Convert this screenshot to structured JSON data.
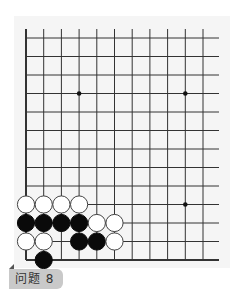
{
  "problem": {
    "label": "问题 8",
    "label_bg": "#c9c9c9"
  },
  "board": {
    "columns_visible": 11,
    "rows_visible": 13,
    "edges": [
      "left",
      "bottom"
    ],
    "star_points": [
      {
        "col": 3,
        "row": 3
      },
      {
        "col": 9,
        "row": 3
      },
      {
        "col": 9,
        "row": 9
      }
    ],
    "stones": [
      {
        "color": "white",
        "col": 0,
        "row": 9
      },
      {
        "color": "white",
        "col": 1,
        "row": 9
      },
      {
        "color": "white",
        "col": 2,
        "row": 9
      },
      {
        "color": "white",
        "col": 3,
        "row": 9
      },
      {
        "color": "black",
        "col": 0,
        "row": 10
      },
      {
        "color": "black",
        "col": 1,
        "row": 10
      },
      {
        "color": "black",
        "col": 2,
        "row": 10
      },
      {
        "color": "black",
        "col": 3,
        "row": 10
      },
      {
        "color": "white",
        "col": 4,
        "row": 10
      },
      {
        "color": "white",
        "col": 5,
        "row": 10
      },
      {
        "color": "white",
        "col": 0,
        "row": 11
      },
      {
        "color": "white",
        "col": 1,
        "row": 11
      },
      {
        "color": "black",
        "col": 3,
        "row": 11
      },
      {
        "color": "black",
        "col": 4,
        "row": 11
      },
      {
        "color": "white",
        "col": 5,
        "row": 11
      },
      {
        "color": "black",
        "col": 1,
        "row": 12
      }
    ]
  }
}
